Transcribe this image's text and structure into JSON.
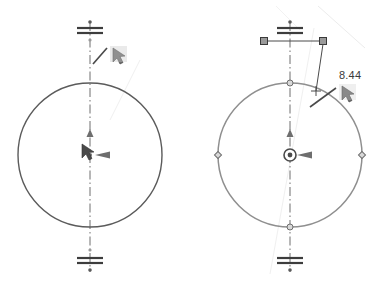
{
  "canvas": {
    "width": 381,
    "height": 287,
    "background": "#ffffff"
  },
  "colors": {
    "geometry_unselected": "#5b5b5b",
    "geometry_selected": "#8f8f8f",
    "centerline": "#6e6e6e",
    "dimension": "#4a4a4a",
    "handle_fill": "#9a9a9a",
    "handle_stroke": "#4a4a4a",
    "point_marker": "#7a7a7a",
    "construction_faint": "#e2e2e2",
    "text": "#3a3a3a"
  },
  "views": [
    {
      "id": "before",
      "name": "circle-before-dimension",
      "circle": {
        "cx": 90,
        "cy": 155,
        "r": 72,
        "state": "unselected"
      },
      "centerline": {
        "x": 90,
        "y1": 22,
        "y2": 272,
        "style": "dash-dot"
      },
      "endpoint_markers": [
        {
          "name": "centerline-top-endpoint",
          "x": 90,
          "y": 30
        },
        {
          "name": "centerline-bottom-endpoint",
          "x": 90,
          "y": 262
        }
      ],
      "center_point": {
        "x": 90,
        "y": 155,
        "style": "plain"
      },
      "cursors": [
        {
          "name": "smart-dimension-cursor-top",
          "x": 96,
          "y": 50,
          "glyph": "arrow-with-dimension-line"
        },
        {
          "name": "select-cursor-center",
          "x": 84,
          "y": 146,
          "glyph": "arrow-pointer"
        }
      ],
      "labels": []
    },
    {
      "id": "after",
      "name": "circle-with-dimension",
      "circle": {
        "cx": 290,
        "cy": 155,
        "r": 72,
        "state": "selected"
      },
      "centerline": {
        "x": 290,
        "y1": 22,
        "y2": 272,
        "style": "dash-dot"
      },
      "endpoint_markers": [
        {
          "name": "centerline-top-endpoint",
          "x": 290,
          "y": 30
        },
        {
          "name": "centerline-bottom-endpoint",
          "x": 290,
          "y": 262
        }
      ],
      "center_point": {
        "x": 290,
        "y": 155,
        "style": "concentric-circle"
      },
      "quadrant_points": [
        {
          "name": "quadrant-top",
          "x": 290,
          "y": 83
        },
        {
          "name": "quadrant-bottom",
          "x": 290,
          "y": 227
        },
        {
          "name": "quadrant-left",
          "x": 218,
          "y": 155
        },
        {
          "name": "quadrant-right",
          "x": 362,
          "y": 155
        }
      ],
      "dimension": {
        "value": "8.44",
        "text_x": 341,
        "text_y": 78,
        "witness_line": {
          "x1": 264,
          "y1": 41,
          "x2": 323,
          "y2": 41
        },
        "handles": [
          {
            "name": "dimension-handle-left",
            "x": 264,
            "y": 41
          },
          {
            "name": "dimension-handle-right",
            "x": 323,
            "y": 41
          }
        ],
        "leader": {
          "x1": 323,
          "y1": 41,
          "x2": 316,
          "y2": 90
        },
        "arrow_tick": {
          "x1": 316,
          "y1": 107,
          "x2": 340,
          "y2": 89
        }
      },
      "cursors": [
        {
          "name": "smart-dimension-cursor",
          "x": 348,
          "y": 92,
          "glyph": "arrow-pointer"
        }
      ],
      "construction_lines": [
        {
          "name": "faint-construction-upper-right",
          "x1": 316,
          "y1": 8,
          "x2": 360,
          "y2": 46
        },
        {
          "name": "faint-construction-lower-left",
          "x1": 272,
          "y1": 272,
          "x2": 314,
          "y2": 30
        }
      ]
    }
  ],
  "annotations": {
    "dimension_value_label": "8.44"
  }
}
